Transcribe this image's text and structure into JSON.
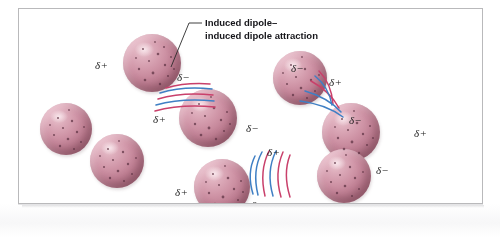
{
  "figure": {
    "type": "chemistry-illustration",
    "background_color": "#ffffff",
    "frame_color": "#b9b9bb"
  },
  "callout": {
    "line1": "Induced dipole–",
    "line2": "induced dipole attraction"
  },
  "charges": {
    "positive": "δ+",
    "negative": "δ−"
  },
  "colors": {
    "sphere_light": "#e9c3cd",
    "sphere_mid": "#cf94a6",
    "sphere_dark": "#8e5264",
    "attraction_blue": "#3f7fc4",
    "attraction_red": "#c9406b",
    "label_text": "#1b1b1b",
    "leader_line": "#2a2a2a"
  },
  "spheres": [
    {
      "id": "sphere-1",
      "x": 104,
      "y": 25,
      "d": 58
    },
    {
      "id": "sphere-2",
      "x": 160,
      "y": 80,
      "d": 58
    },
    {
      "id": "sphere-3",
      "x": 254,
      "y": 42,
      "d": 54
    },
    {
      "id": "sphere-4",
      "x": 303,
      "y": 94,
      "d": 58
    },
    {
      "id": "sphere-5",
      "x": 71,
      "y": 125,
      "d": 54
    },
    {
      "id": "sphere-6",
      "x": 175,
      "y": 150,
      "d": 56
    },
    {
      "id": "sphere-7",
      "x": 298,
      "y": 140,
      "d": 54
    },
    {
      "id": "sphere-8",
      "x": 21,
      "y": 94,
      "d": 52
    }
  ],
  "labels": [
    {
      "id": "label-1",
      "text": "δ+",
      "x": 76,
      "y": 50,
      "size": "normal"
    },
    {
      "id": "label-2",
      "text": "δ−",
      "x": 158,
      "y": 62,
      "size": "normal"
    },
    {
      "id": "label-3",
      "text": "δ+",
      "x": 134,
      "y": 104,
      "size": "normal"
    },
    {
      "id": "label-4",
      "text": "δ−",
      "x": 227,
      "y": 113,
      "size": "normal"
    },
    {
      "id": "label-5",
      "text": "δ−",
      "x": 272,
      "y": 53,
      "size": "normal"
    },
    {
      "id": "label-6",
      "text": "δ+",
      "x": 310,
      "y": 67,
      "size": "normal"
    },
    {
      "id": "label-7",
      "text": "δ−",
      "x": 330,
      "y": 105,
      "size": "normal"
    },
    {
      "id": "label-8",
      "text": "δ+",
      "x": 395,
      "y": 118,
      "size": "normal"
    },
    {
      "id": "label-9",
      "text": "δ+",
      "x": 248,
      "y": 137,
      "size": "normal"
    },
    {
      "id": "label-10",
      "text": "δ−",
      "x": 232,
      "y": 190,
      "size": "normal"
    },
    {
      "id": "label-11",
      "text": "δ+",
      "x": 156,
      "y": 177,
      "size": "normal"
    },
    {
      "id": "label-12",
      "text": "δ−",
      "x": 357,
      "y": 155,
      "size": "normal"
    }
  ]
}
